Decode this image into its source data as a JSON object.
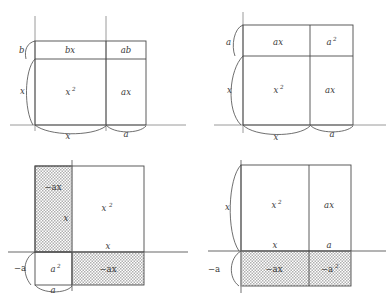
{
  "figure": {
    "type": "diagram",
    "panel_count": 4,
    "style": {
      "line_color": "#4a4a4a",
      "axis_color": "#8a8a8a",
      "text_color": "#3a3a3a",
      "shade_pattern": "fine-dot-stipple",
      "shade_color": "#9a9a9a",
      "background": "#ffffff"
    }
  },
  "panels": [
    {
      "id": "top-left",
      "position": "top-left",
      "shaded": false,
      "regions": [
        {
          "name": "region-top-left",
          "label": "bx",
          "sup": "",
          "shaded": false
        },
        {
          "name": "region-top-right",
          "label": "ab",
          "sup": "",
          "shaded": false
        },
        {
          "name": "region-bottom-left",
          "label": "x",
          "sup": "2",
          "shaded": false
        },
        {
          "name": "region-bottom-right",
          "label": "ax",
          "sup": "",
          "shaded": false
        }
      ],
      "dimension_labels": [
        {
          "name": "brace-left-upper",
          "label": "b",
          "sup": "",
          "side": "left"
        },
        {
          "name": "brace-left-lower",
          "label": "x",
          "sup": "",
          "side": "left"
        },
        {
          "name": "brace-bottom-left",
          "label": "x",
          "sup": "",
          "side": "bottom"
        },
        {
          "name": "brace-bottom-right",
          "label": "a",
          "sup": "",
          "side": "bottom"
        }
      ]
    },
    {
      "id": "top-right",
      "position": "top-right",
      "shaded": false,
      "regions": [
        {
          "name": "region-top-left",
          "label": "ax",
          "sup": "",
          "shaded": false
        },
        {
          "name": "region-top-right",
          "label": "a",
          "sup": "2",
          "shaded": false
        },
        {
          "name": "region-bottom-left",
          "label": "x",
          "sup": "2",
          "shaded": false
        },
        {
          "name": "region-bottom-right",
          "label": "ax",
          "sup": "",
          "shaded": false
        }
      ],
      "dimension_labels": [
        {
          "name": "brace-left-upper",
          "label": "a",
          "sup": "",
          "side": "left"
        },
        {
          "name": "brace-left-lower",
          "label": "x",
          "sup": "",
          "side": "left"
        },
        {
          "name": "brace-bottom-left",
          "label": "x",
          "sup": "",
          "side": "bottom"
        },
        {
          "name": "brace-bottom-right",
          "label": "a",
          "sup": "",
          "side": "bottom"
        }
      ]
    },
    {
      "id": "bottom-left",
      "position": "bottom-left",
      "shaded": true,
      "regions": [
        {
          "name": "region-upper-strip",
          "label": "−ax",
          "sup": "",
          "shaded": true
        },
        {
          "name": "region-main-square",
          "label": "x",
          "sup": "2",
          "shaded": false
        },
        {
          "name": "region-lower-left",
          "label": "a",
          "sup": "2",
          "shaded": false
        },
        {
          "name": "region-lower-strip",
          "label": "−ax",
          "sup": "",
          "shaded": true
        }
      ],
      "inner_labels": [
        {
          "name": "inner-label-vertical",
          "label": "x",
          "sup": ""
        },
        {
          "name": "inner-label-horizontal",
          "label": "x",
          "sup": ""
        }
      ],
      "dimension_labels": [
        {
          "name": "brace-left-neg-a",
          "label": "−a",
          "sup": "",
          "side": "left"
        },
        {
          "name": "brace-bottom-a",
          "label": "a",
          "sup": "",
          "side": "bottom"
        }
      ]
    },
    {
      "id": "bottom-right",
      "position": "bottom-right",
      "shaded": true,
      "regions": [
        {
          "name": "region-top-left",
          "label": "x",
          "sup": "2",
          "shaded": false
        },
        {
          "name": "region-top-right",
          "label": "ax",
          "sup": "",
          "shaded": false
        },
        {
          "name": "region-bottom-left",
          "label": "−ax",
          "sup": "",
          "shaded": true
        },
        {
          "name": "region-bottom-right",
          "label": "−a",
          "sup": "2",
          "shaded": true
        }
      ],
      "inner_labels": [
        {
          "name": "inner-label-x",
          "label": "x",
          "sup": ""
        },
        {
          "name": "inner-label-a",
          "label": "a",
          "sup": ""
        }
      ],
      "dimension_labels": [
        {
          "name": "brace-left-x",
          "label": "x",
          "sup": "",
          "side": "left"
        },
        {
          "name": "brace-left-neg-a",
          "label": "−a",
          "sup": "",
          "side": "left"
        }
      ]
    }
  ]
}
